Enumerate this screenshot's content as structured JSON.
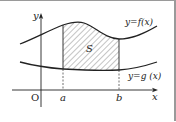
{
  "diagram": {
    "labels": {
      "y_axis": "y",
      "x_axis": "x",
      "origin": "O",
      "a": "a",
      "b": "b",
      "area": "S",
      "f_curve": "y=f(x)",
      "g_curve": "y=g (x)"
    },
    "colors": {
      "stroke": "#222222",
      "hatch": "#555555",
      "border": "#9a9a9a"
    }
  }
}
